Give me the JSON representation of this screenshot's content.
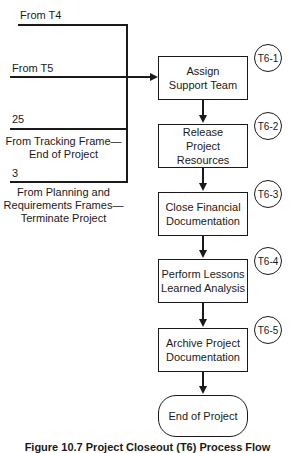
{
  "inputs": {
    "t4": "From T4",
    "t5": "From T5",
    "tracking_number": "25",
    "tracking_text": "From Tracking Frame—\nEnd of Project",
    "planning_number": "3",
    "planning_text": "From Planning and\nRequirements Frames—\nTerminate Project"
  },
  "steps": [
    {
      "id": "T6-1",
      "label": "Assign\nSupport Team"
    },
    {
      "id": "T6-2",
      "label": "Release\nProject Resources"
    },
    {
      "id": "T6-3",
      "label": "Close Financial\nDocumentation"
    },
    {
      "id": "T6-4",
      "label": "Perform Lessons\nLearned Analysis"
    },
    {
      "id": "T6-5",
      "label": "Archive Project\nDocumentation"
    }
  ],
  "end": {
    "label": "End of Project"
  },
  "caption": "Figure 10.7 Project Closeout (T6) Process Flow"
}
